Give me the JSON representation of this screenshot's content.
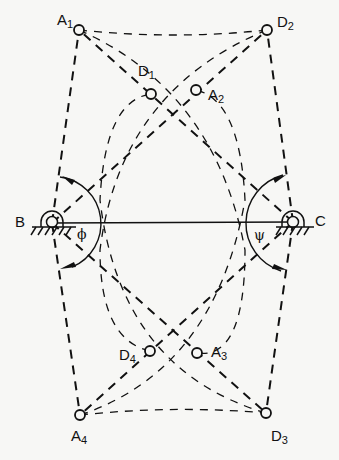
{
  "diagram": {
    "pivots": [
      {
        "id": "B",
        "label": "B",
        "x": 52,
        "y": 223
      },
      {
        "id": "C",
        "label": "C",
        "x": 293,
        "y": 222
      }
    ],
    "points": [
      {
        "id": "A1",
        "base": "A",
        "sub": "1",
        "x": 79,
        "y": 30
      },
      {
        "id": "D1",
        "base": "D",
        "sub": "1",
        "x": 151,
        "y": 94
      },
      {
        "id": "A2",
        "base": "A",
        "sub": "2",
        "x": 196,
        "y": 90
      },
      {
        "id": "D2",
        "base": "D",
        "sub": "2",
        "x": 267,
        "y": 30
      },
      {
        "id": "D4",
        "base": "D",
        "sub": "4",
        "x": 150,
        "y": 351
      },
      {
        "id": "A3",
        "base": "A",
        "sub": "3",
        "x": 197,
        "y": 353
      },
      {
        "id": "A4",
        "base": "A",
        "sub": "4",
        "x": 80,
        "y": 415
      },
      {
        "id": "D3",
        "base": "D",
        "sub": "3",
        "x": 266,
        "y": 413
      }
    ],
    "angles": {
      "phi": "ϕ",
      "psi": "ψ"
    },
    "labels": {
      "B": "B",
      "C": "C",
      "A1": {
        "base": "A",
        "sub": "1"
      },
      "D1": {
        "base": "D",
        "sub": "1"
      },
      "A2": {
        "base": "A",
        "sub": "2"
      },
      "D2": {
        "base": "D",
        "sub": "2"
      },
      "D4": {
        "base": "D",
        "sub": "4"
      },
      "A3": {
        "base": "A",
        "sub": "3"
      },
      "A4": {
        "base": "A",
        "sub": "4"
      },
      "D3": {
        "base": "D",
        "sub": "3"
      }
    },
    "colors": {
      "ink": "#111111",
      "paper": "#f7f7f5"
    }
  }
}
